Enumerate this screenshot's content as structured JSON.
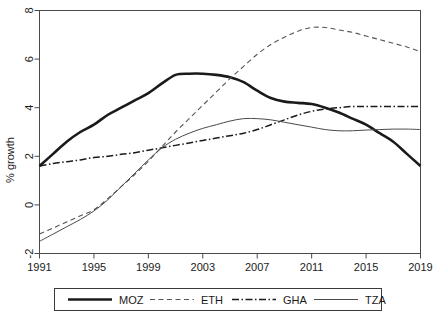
{
  "chart_data": {
    "type": "line",
    "title": "",
    "xlabel": "",
    "ylabel": "% growth",
    "xlim": [
      1991,
      2019
    ],
    "ylim": [
      -2,
      8
    ],
    "grid": false,
    "legend_position": "bottom",
    "x": [
      1991,
      1992,
      1993,
      1994,
      1995,
      1996,
      1997,
      1998,
      1999,
      2000,
      2001,
      2002,
      2003,
      2004,
      2005,
      2006,
      2007,
      2008,
      2009,
      2010,
      2011,
      2012,
      2013,
      2014,
      2015,
      2016,
      2017,
      2018,
      2019
    ],
    "xticks": [
      1991,
      1995,
      1999,
      2003,
      2007,
      2011,
      2015,
      2019
    ],
    "yticks": [
      -2,
      0,
      2,
      4,
      6,
      8
    ],
    "series": [
      {
        "name": "MOZ",
        "style": "solid-thick",
        "color": "#1a1a1a",
        "values": [
          1.6,
          2.1,
          2.6,
          3.0,
          3.3,
          3.7,
          4.0,
          4.3,
          4.6,
          5.0,
          5.35,
          5.4,
          5.4,
          5.35,
          5.25,
          5.05,
          4.7,
          4.4,
          4.25,
          4.2,
          4.15,
          4.0,
          3.8,
          3.55,
          3.3,
          2.95,
          2.6,
          2.1,
          1.6
        ]
      },
      {
        "name": "ETH",
        "style": "dashed",
        "color": "#555555",
        "values": [
          -1.2,
          -0.95,
          -0.7,
          -0.45,
          -0.2,
          0.25,
          0.75,
          1.25,
          1.8,
          2.4,
          3.0,
          3.55,
          4.1,
          4.65,
          5.2,
          5.7,
          6.2,
          6.6,
          6.9,
          7.15,
          7.3,
          7.3,
          7.2,
          7.1,
          6.95,
          6.8,
          6.65,
          6.5,
          6.3
        ]
      },
      {
        "name": "GHA",
        "style": "dashdot",
        "color": "#1a1a1a",
        "values": [
          1.6,
          1.7,
          1.78,
          1.85,
          1.95,
          2.0,
          2.08,
          2.15,
          2.25,
          2.35,
          2.45,
          2.55,
          2.65,
          2.75,
          2.85,
          2.95,
          3.1,
          3.3,
          3.5,
          3.7,
          3.85,
          3.95,
          4.0,
          4.05,
          4.05,
          4.05,
          4.05,
          4.05,
          4.05
        ]
      },
      {
        "name": "TZA",
        "style": "solid-thin",
        "color": "#4a4a4a",
        "values": [
          -1.5,
          -1.2,
          -0.9,
          -0.6,
          -0.25,
          0.2,
          0.75,
          1.3,
          1.85,
          2.35,
          2.7,
          2.95,
          3.15,
          3.3,
          3.45,
          3.55,
          3.55,
          3.5,
          3.4,
          3.3,
          3.2,
          3.1,
          3.05,
          3.05,
          3.08,
          3.1,
          3.12,
          3.12,
          3.1
        ]
      }
    ],
    "legend_entries": [
      {
        "label": "MOZ",
        "style": "solid-thick"
      },
      {
        "label": "ETH",
        "style": "dashed"
      },
      {
        "label": "GHA",
        "style": "dashdot"
      },
      {
        "label": "TZA",
        "style": "solid-thin"
      }
    ]
  }
}
